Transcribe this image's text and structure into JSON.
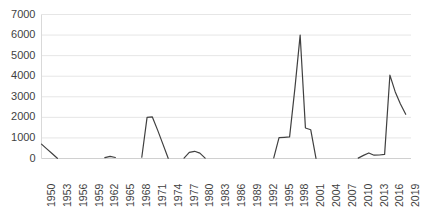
{
  "chart_data": {
    "type": "line",
    "title": "",
    "subtitle": "",
    "xlabel": "",
    "ylabel": "",
    "legend": [],
    "legend_position": "none",
    "grid": true,
    "grid_axis": "y",
    "ylim": [
      0,
      7000
    ],
    "ytick_values": [
      0,
      1000,
      2000,
      3000,
      4000,
      5000,
      6000,
      7000
    ],
    "ytick_labels": [
      "0",
      "1000",
      "2000",
      "3000",
      "4000",
      "5000",
      "6000",
      "7000"
    ],
    "xlim": [
      1950,
      2020
    ],
    "xtick_labels": [
      "1950",
      "1953",
      "1956",
      "1959",
      "1962",
      "1965",
      "1968",
      "1971",
      "1974",
      "1977",
      "1980",
      "1983",
      "1986",
      "1989",
      "1992",
      "1995",
      "1998",
      "2001",
      "2004",
      "2007",
      "2010",
      "2013",
      "2016",
      "2019"
    ],
    "xtick_values": [
      1950,
      1953,
      1956,
      1959,
      1962,
      1965,
      1968,
      1971,
      1974,
      1977,
      1980,
      1983,
      1986,
      1989,
      1992,
      1995,
      1998,
      2001,
      2004,
      2007,
      2010,
      2013,
      2016,
      2019
    ],
    "xtick_rotation": 90,
    "line_color": "#404040",
    "line_width": 1.2,
    "series": [
      {
        "name": "series-1",
        "x": [
          1950,
          1951,
          1952,
          1953,
          1962,
          1963,
          1964,
          1969,
          1970,
          1971,
          1972,
          1973,
          1974,
          1977,
          1978,
          1979,
          1980,
          1981,
          1994,
          1995,
          1996,
          1997,
          1998,
          1999,
          2000,
          2001,
          2002,
          2010,
          2011,
          2012,
          2013,
          2014,
          2015,
          2016,
          2017,
          2018,
          2019
        ],
        "values": [
          700,
          470,
          240,
          10,
          40,
          100,
          50,
          60,
          2000,
          2020,
          1380,
          700,
          10,
          20,
          300,
          350,
          260,
          20,
          30,
          1010,
          1030,
          1050,
          3400,
          6000,
          1480,
          1400,
          10,
          20,
          150,
          270,
          160,
          170,
          200,
          4050,
          3250,
          2650,
          2150
        ],
        "gaps_after_x": [
          1953,
          1964,
          1974,
          1981,
          2002
        ]
      }
    ]
  },
  "axes": {
    "y_axis_name": "value-axis",
    "x_axis_name": "year-axis"
  }
}
